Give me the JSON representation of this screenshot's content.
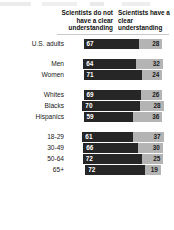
{
  "chart_data": {
    "type": "bar",
    "title": "",
    "subtitle": "",
    "xlabel": "",
    "ylabel": "",
    "orientation": "horizontal",
    "stacked": true,
    "grid": false,
    "legend_position": "top",
    "value_unit": "%",
    "xlim": [
      0,
      100
    ],
    "categories": [
      "U.S. adults",
      "Men",
      "Women",
      "Whites",
      "Blacks",
      "Hispanics",
      "18-29",
      "30-49",
      "50-64",
      "65+"
    ],
    "series": [
      {
        "name": "Scientists do not have a clear understanding",
        "color": "#262626",
        "values": [
          67,
          64,
          71,
          69,
          70,
          59,
          61,
          66,
          72,
          72
        ]
      },
      {
        "name": "Scientists have a clear understanding",
        "color": "#b4b4b4",
        "values": [
          28,
          32,
          24,
          26,
          28,
          36,
          37,
          30,
          25,
          19
        ]
      }
    ]
  },
  "header": {
    "col_left": "Scientists do not have a clear understanding",
    "col_right": "Scientists have a clear understanding"
  },
  "rows": [
    {
      "label": "U.S. adults",
      "dark": "67",
      "light": "28",
      "group": 0
    },
    {
      "label": "Men",
      "dark": "64",
      "light": "32",
      "group": 1
    },
    {
      "label": "Women",
      "dark": "71",
      "light": "24",
      "group": 1
    },
    {
      "label": "Whites",
      "dark": "69",
      "light": "26",
      "group": 2
    },
    {
      "label": "Blacks",
      "dark": "70",
      "light": "28",
      "group": 2
    },
    {
      "label": "Hispanics",
      "dark": "59",
      "light": "36",
      "group": 2
    },
    {
      "label": "18-29",
      "dark": "61",
      "light": "37",
      "group": 3
    },
    {
      "label": "30-49",
      "dark": "66",
      "light": "30",
      "group": 3
    },
    {
      "label": "50-64",
      "dark": "72",
      "light": "25",
      "group": 3
    },
    {
      "label": "65+",
      "dark": "72",
      "light": "19",
      "group": 3
    }
  ],
  "colors": {
    "dark_segment": "#262626",
    "light_segment": "#b4b4b4",
    "text": "#1a1a1a",
    "background": "#ffffff"
  }
}
